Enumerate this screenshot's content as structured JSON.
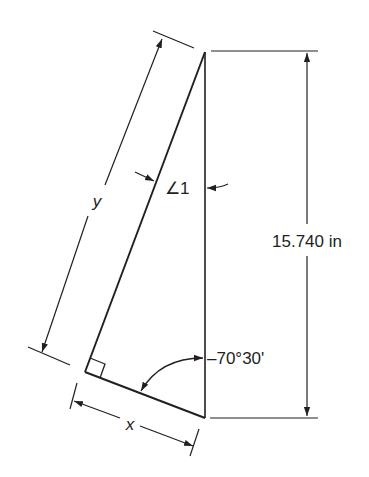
{
  "diagram": {
    "type": "right-triangle-dimension-drawing",
    "colors": {
      "line": "#231f20",
      "background": "#ffffff"
    },
    "labels": {
      "vertical_dimension": "15.740 in",
      "hypotenuse_dimension": "y",
      "base_dimension": "x",
      "angle_one": "∠1",
      "bottom_angle": "–70°30'"
    },
    "geometry": {
      "top_vertex": [
        205,
        52
      ],
      "bottom_vertex": [
        205,
        418
      ],
      "right_angle_vertex": [
        85,
        372
      ]
    }
  }
}
